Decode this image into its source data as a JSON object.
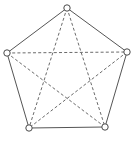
{
  "figure": {
    "canvas_width": 134,
    "canvas_height": 144,
    "background_color": "#ffffff"
  },
  "chart_data": {
    "type": "diagram",
    "subtype": "graph-node-link",
    "node_count": 5,
    "edge_count": 10,
    "nodes": [
      {
        "id": "top",
        "label": "",
        "x": 67,
        "y": 8,
        "radius": 3.2,
        "style": "hollow-circle"
      },
      {
        "id": "right",
        "label": "",
        "x": 127,
        "y": 52,
        "radius": 3.2,
        "style": "hollow-circle"
      },
      {
        "id": "bottom-right",
        "label": "",
        "x": 105,
        "y": 127,
        "radius": 3.2,
        "style": "hollow-circle"
      },
      {
        "id": "bottom-left",
        "label": "",
        "x": 29,
        "y": 128,
        "radius": 3.2,
        "style": "hollow-circle"
      },
      {
        "id": "left",
        "label": "",
        "x": 7,
        "y": 53,
        "radius": 3.2,
        "style": "hollow-circle"
      }
    ],
    "edges": [
      {
        "id": "edge-top-right",
        "from": "top",
        "to": "right",
        "style": "solid",
        "group": "outer-perimeter"
      },
      {
        "id": "edge-right-bottomright",
        "from": "right",
        "to": "bottom-right",
        "style": "solid",
        "group": "outer-perimeter"
      },
      {
        "id": "edge-bottomright-bottomleft",
        "from": "bottom-right",
        "to": "bottom-left",
        "style": "solid",
        "group": "outer-perimeter"
      },
      {
        "id": "edge-bottomleft-left",
        "from": "bottom-left",
        "to": "left",
        "style": "solid",
        "group": "outer-perimeter"
      },
      {
        "id": "edge-left-top",
        "from": "left",
        "to": "top",
        "style": "solid",
        "group": "outer-perimeter"
      },
      {
        "id": "edge-left-right",
        "from": "left",
        "to": "right",
        "style": "dashed",
        "group": "chord"
      },
      {
        "id": "edge-top-bottomleft",
        "from": "top",
        "to": "bottom-left",
        "style": "dashed",
        "group": "pentagram"
      },
      {
        "id": "edge-top-bottomright",
        "from": "top",
        "to": "bottom-right",
        "style": "dashed",
        "group": "pentagram"
      },
      {
        "id": "edge-left-bottomright",
        "from": "left",
        "to": "bottom-right",
        "style": "dashed",
        "group": "pentagram"
      },
      {
        "id": "edge-right-bottomleft",
        "from": "right",
        "to": "bottom-left",
        "style": "dashed",
        "group": "pentagram"
      }
    ],
    "colors": {
      "solid_edge": "#555555",
      "dashed_edge": "#6b6b6b",
      "node_stroke": "#4a4a4a",
      "node_fill": "#ffffff",
      "background": "#ffffff"
    },
    "legend": [],
    "annotations": [],
    "axis_labels": {
      "xlabel": "",
      "ylabel": ""
    },
    "grid": false
  }
}
